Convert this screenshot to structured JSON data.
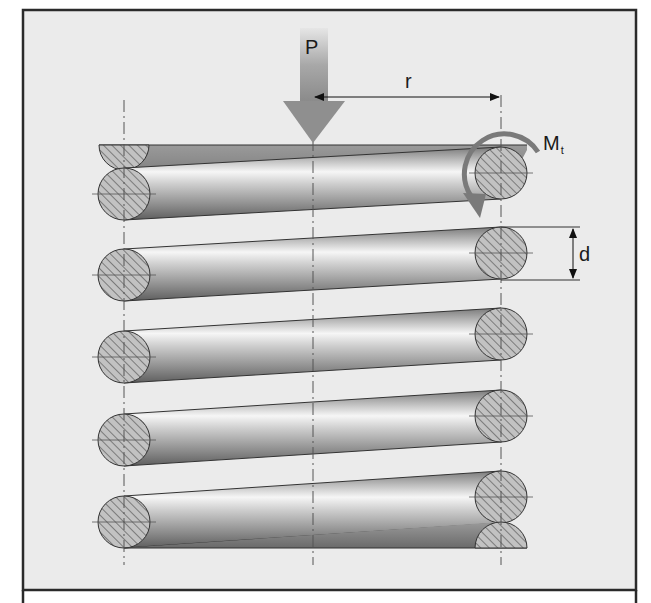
{
  "figure": {
    "background": "#ebebeb",
    "frame_color": "#2a2a2a",
    "labels": {
      "load": "P",
      "radius": "r",
      "torque": "M",
      "torque_sub": "t",
      "wire_diameter": "d"
    },
    "colors": {
      "arrow": "#8a8a8a",
      "wire_dark": "#6e6e6e",
      "wire_light": "#f4f4f4",
      "section_fill": "#b9b9b9",
      "hatch": "#5a5a5a",
      "torque_arrow": "#7a7a7a"
    },
    "geometry": {
      "left_axis_x": 124,
      "center_axis_x": 313,
      "right_axis_x": 501,
      "wire_radius": 26,
      "coil_count": 5,
      "left_centers_y": [
        194,
        275,
        357,
        440,
        522
      ],
      "right_centers_y": [
        173,
        253,
        334,
        416,
        497
      ]
    }
  }
}
